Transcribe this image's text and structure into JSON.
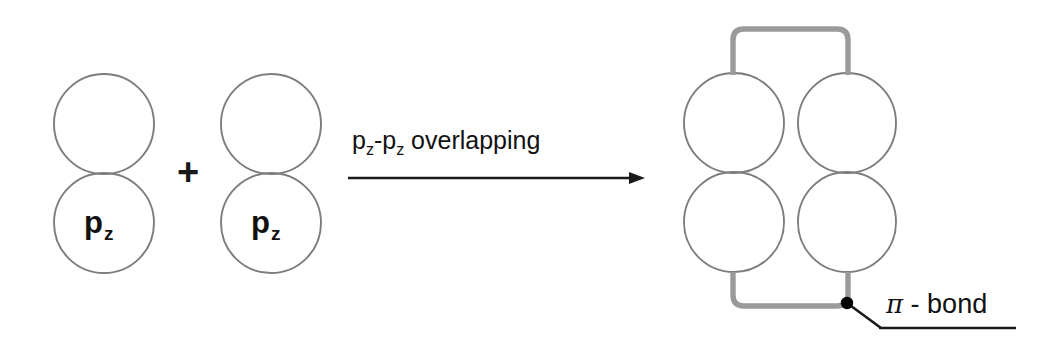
{
  "diagram": {
    "colors": {
      "orbital_stroke": "#7d7d7d",
      "bracket_stroke": "#9a9a9a",
      "arrow": "#1a1a1a",
      "text": "#111111",
      "background": "#ffffff",
      "dot": "#000000"
    },
    "reactants": {
      "orbital_left": {
        "label_p": "p",
        "label_sub": "z",
        "lobe_count": 2
      },
      "plus_operator": "+",
      "orbital_right": {
        "label_p": "p",
        "label_sub": "z",
        "lobe_count": 2
      }
    },
    "reaction_arrow": {
      "caption_prefix": "p",
      "caption_sub_1": "z",
      "caption_dash": "-p",
      "caption_sub_2": "z",
      "caption_suffix": " overlapping",
      "direction": "right"
    },
    "product": {
      "lobe_count": 4,
      "bracket_top": "pi-overlap-bracket-top",
      "bracket_bottom": "pi-overlap-bracket-bottom",
      "callout": {
        "pi_symbol": "π",
        "separator": " - ",
        "word": "bond"
      }
    }
  }
}
